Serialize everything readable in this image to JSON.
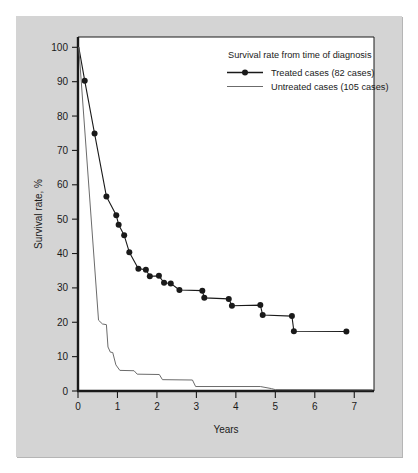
{
  "figure": {
    "panel_background": "#d4d4d4",
    "plot_background": "#ffffff",
    "frame_color": "#1a1a1a",
    "treated_color": "#1a1a1a",
    "untreated_color": "#6b6b6b"
  },
  "legend": {
    "title": "Survival rate from time of diagnosis",
    "entries": [
      {
        "label": "Treated cases (82 cases)",
        "marker": "line-with-dot",
        "color": "#1a1a1a"
      },
      {
        "label": "Untreated cases (105 cases)",
        "marker": "line",
        "color": "#6b6b6b"
      }
    ]
  },
  "chart_data": {
    "type": "line",
    "title": "Survival rate from time of diagnosis",
    "xlabel": "Years",
    "ylabel": "Survival rate, %",
    "xlim": [
      0,
      7.5
    ],
    "ylim": [
      0,
      103
    ],
    "xticks": [
      0,
      1,
      2,
      3,
      4,
      5,
      6,
      7
    ],
    "xtick_labels": [
      "0",
      "1",
      "2",
      "3",
      "4",
      "5",
      "6",
      "7"
    ],
    "yticks": [
      0,
      10,
      20,
      30,
      40,
      50,
      60,
      70,
      80,
      90,
      100
    ],
    "ytick_labels": [
      "0",
      "10",
      "20",
      "30",
      "40",
      "50",
      "60",
      "70",
      "80",
      "90",
      "100"
    ],
    "grid": false,
    "legend_position": "top-right",
    "series": [
      {
        "name": "Treated cases (82 cases)",
        "n_cases": 82,
        "color": "#1a1a1a",
        "markers": true,
        "points": [
          [
            0.02,
            100.0
          ],
          [
            0.17,
            90.3
          ],
          [
            0.42,
            74.9
          ],
          [
            0.72,
            56.6
          ],
          [
            0.97,
            51.1
          ],
          [
            1.03,
            48.4
          ],
          [
            1.17,
            45.3
          ],
          [
            1.3,
            40.4
          ],
          [
            1.53,
            35.6
          ],
          [
            1.72,
            35.3
          ],
          [
            1.82,
            33.4
          ],
          [
            2.05,
            33.5
          ],
          [
            2.18,
            31.5
          ],
          [
            2.35,
            31.3
          ],
          [
            2.57,
            29.4
          ],
          [
            3.15,
            29.2
          ],
          [
            3.2,
            27.1
          ],
          [
            3.82,
            26.8
          ],
          [
            3.9,
            24.8
          ],
          [
            4.62,
            25.0
          ],
          [
            4.68,
            22.1
          ],
          [
            5.42,
            21.8
          ],
          [
            5.47,
            17.4
          ],
          [
            6.8,
            17.3
          ]
        ]
      },
      {
        "name": "Untreated cases (105 cases)",
        "n_cases": 105,
        "color": "#6b6b6b",
        "markers": false,
        "points": [
          [
            0.02,
            100.0
          ],
          [
            0.52,
            20.6
          ],
          [
            0.62,
            19.5
          ],
          [
            0.72,
            19.3
          ],
          [
            0.76,
            12.8
          ],
          [
            0.82,
            11.3
          ],
          [
            0.88,
            11.2
          ],
          [
            0.96,
            7.6
          ],
          [
            1.06,
            6.0
          ],
          [
            1.42,
            5.9
          ],
          [
            1.5,
            4.9
          ],
          [
            2.06,
            4.8
          ],
          [
            2.14,
            3.3
          ],
          [
            2.9,
            3.2
          ],
          [
            2.98,
            1.3
          ],
          [
            4.62,
            1.3
          ],
          [
            4.9,
            0.7
          ],
          [
            5.0,
            0.4
          ],
          [
            7.45,
            0.35
          ]
        ]
      }
    ]
  }
}
